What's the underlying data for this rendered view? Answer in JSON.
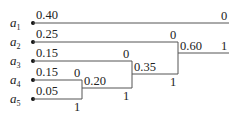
{
  "diagram": {
    "type": "huffman-coding-tree",
    "symbols": [
      {
        "name": "a",
        "sub": "1",
        "prob": "0.40"
      },
      {
        "name": "a",
        "sub": "2",
        "prob": "0.25"
      },
      {
        "name": "a",
        "sub": "3",
        "prob": "0.15"
      },
      {
        "name": "a",
        "sub": "4",
        "prob": "0.15"
      },
      {
        "name": "a",
        "sub": "5",
        "prob": "0.05"
      }
    ],
    "merges": [
      {
        "value": "0.20",
        "upper_bit": "0",
        "lower_bit": "1"
      },
      {
        "value": "0.35",
        "upper_bit": "0",
        "lower_bit": "1"
      },
      {
        "value": "0.60",
        "upper_bit": "0",
        "lower_bit": "1"
      }
    ],
    "root": {
      "upper_bit": "0",
      "lower_bit": "1"
    }
  }
}
